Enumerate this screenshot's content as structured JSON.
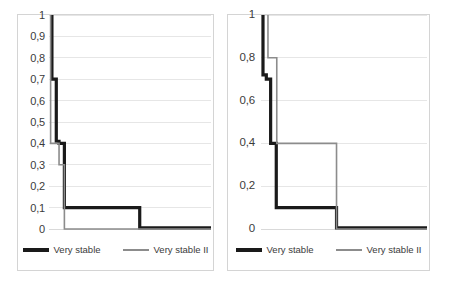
{
  "figure": {
    "background": "#ffffff",
    "panel_border_color": "#d4d4d4",
    "gridline_color": "#e6e6e6"
  },
  "legend": {
    "series_black_label": "Very stable",
    "series_gray_label": "Very stable II",
    "series_black_color": "#1a1a1a",
    "series_gray_color": "#8c8c8c"
  },
  "chart_data": [
    {
      "type": "line",
      "title": "",
      "xlabel": "",
      "ylabel": "",
      "ylim": [
        0,
        1
      ],
      "xlim": [
        0,
        10
      ],
      "grid": true,
      "legend_position": "bottom",
      "step": "post",
      "ytick_labels": [
        "1",
        "0,9",
        "0,8",
        "0,7",
        "0,6",
        "0,5",
        "0,4",
        "0,3",
        "0,2",
        "0,1",
        "0"
      ],
      "ytick_values": [
        1,
        0.9,
        0.8,
        0.7,
        0.6,
        0.5,
        0.4,
        0.3,
        0.2,
        0.1,
        0
      ],
      "xtick_labels": [],
      "series": [
        {
          "name": "Very stable",
          "color": "#1a1a1a",
          "width": 3.2,
          "x": [
            0.18,
            0.18,
            0.45,
            0.45,
            0.62,
            0.62,
            0.95,
            0.95,
            5.6,
            5.6,
            10
          ],
          "y": [
            1.0,
            0.7,
            0.7,
            0.41,
            0.41,
            0.4,
            0.4,
            0.1,
            0.1,
            0.005,
            0.005
          ]
        },
        {
          "name": "Very stable II",
          "color": "#8c8c8c",
          "width": 1.6,
          "x": [
            0.1,
            0.1,
            0.42,
            0.42,
            0.62,
            0.62,
            0.95,
            0.95,
            10
          ],
          "y": [
            1.0,
            0.4,
            0.4,
            0.4,
            0.4,
            0.3,
            0.3,
            0.0,
            0.0
          ]
        }
      ]
    },
    {
      "type": "line",
      "title": "",
      "xlabel": "",
      "ylabel": "",
      "ylim": [
        0,
        1
      ],
      "xlim": [
        0,
        10
      ],
      "grid": true,
      "legend_position": "bottom",
      "step": "post",
      "ytick_labels": [
        "1",
        "0,8",
        "0,6",
        "0,4",
        "0,2",
        "0"
      ],
      "ytick_values": [
        1,
        0.8,
        0.6,
        0.4,
        0.2,
        0
      ],
      "xtick_labels": [],
      "series": [
        {
          "name": "Very stable",
          "color": "#1a1a1a",
          "width": 3.2,
          "x": [
            0.12,
            0.12,
            0.32,
            0.32,
            0.58,
            0.58,
            0.92,
            0.92,
            4.55,
            4.55,
            10
          ],
          "y": [
            1.0,
            0.72,
            0.72,
            0.7,
            0.7,
            0.4,
            0.4,
            0.1,
            0.1,
            0.005,
            0.005
          ]
        },
        {
          "name": "Very stable II",
          "color": "#8c8c8c",
          "width": 1.6,
          "x": [
            0.42,
            0.42,
            0.72,
            0.72,
            0.95,
            0.95,
            4.55,
            4.55,
            10
          ],
          "y": [
            1.0,
            0.8,
            0.8,
            0.8,
            0.8,
            0.4,
            0.4,
            0.0,
            0.0
          ]
        }
      ]
    }
  ]
}
